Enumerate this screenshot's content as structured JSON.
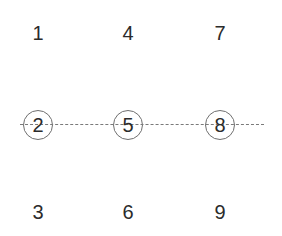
{
  "grid": {
    "rows": [
      [
        "1",
        "4",
        "7"
      ],
      [
        "2",
        "5",
        "8"
      ],
      [
        "3",
        "6",
        "9"
      ]
    ],
    "circled_row": 1,
    "strike_line": {
      "color": "#7a7a7a"
    },
    "circle_color": "#6f6f6f",
    "text_color": "#2b2b2b"
  }
}
